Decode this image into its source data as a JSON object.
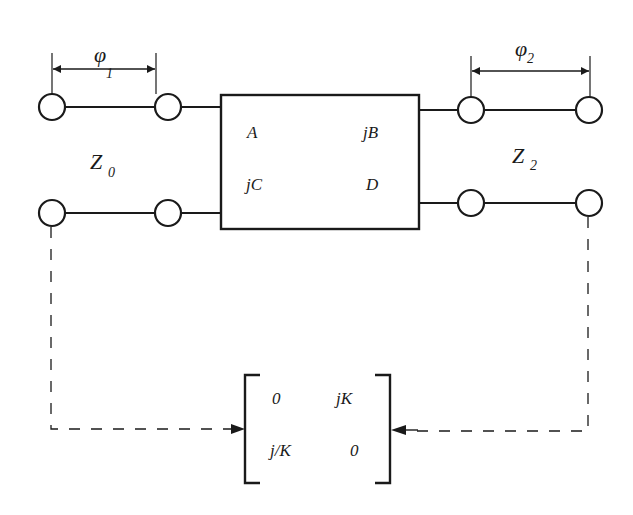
{
  "diagram": {
    "colors": {
      "stroke": "#1a1a1a",
      "background": "#ffffff"
    },
    "left_line": {
      "impedance_label": "Z",
      "impedance_subscript": "0",
      "phase_label": "φ",
      "phase_subscript": "1"
    },
    "right_line": {
      "impedance_label": "Z",
      "impedance_subscript": "2",
      "phase_label": "φ",
      "phase_subscript": "2"
    },
    "abcd_matrix": {
      "a": "A",
      "b": "jB",
      "c": "jC",
      "d": "D"
    },
    "inverter_matrix": {
      "r1c1": "0",
      "r1c2": "jK",
      "r2c1": "j/K",
      "r2c2": "0"
    }
  }
}
